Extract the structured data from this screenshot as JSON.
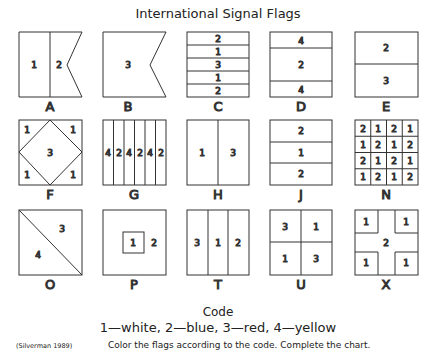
{
  "title": "International Signal Flags",
  "code": {
    "heading": "Code",
    "legend": "1—white, 2—blue, 3—red, 4—yellow",
    "mapping": {
      "1": "white",
      "2": "blue",
      "3": "red",
      "4": "yellow"
    }
  },
  "citation": "(Silverman 1989)",
  "instructions": "Color the flags according to the code. Complete the chart.",
  "flags": [
    {
      "letter": "A",
      "regions": [
        "1",
        "2"
      ]
    },
    {
      "letter": "B",
      "regions": [
        "3"
      ]
    },
    {
      "letter": "C",
      "regions": [
        "2",
        "1",
        "3",
        "1",
        "2"
      ]
    },
    {
      "letter": "D",
      "regions": [
        "4",
        "2",
        "4"
      ]
    },
    {
      "letter": "E",
      "regions": [
        "2",
        "3"
      ]
    },
    {
      "letter": "F",
      "regions": [
        "1",
        "1",
        "3",
        "1",
        "1"
      ]
    },
    {
      "letter": "G",
      "regions": [
        "4",
        "2",
        "4",
        "2",
        "4",
        "2"
      ]
    },
    {
      "letter": "H",
      "regions": [
        "1",
        "3"
      ]
    },
    {
      "letter": "J",
      "regions": [
        "2",
        "1",
        "2"
      ]
    },
    {
      "letter": "N",
      "regions": [
        "2",
        "1",
        "2",
        "1",
        "1",
        "2",
        "1",
        "2",
        "2",
        "1",
        "2",
        "1",
        "1",
        "2",
        "1",
        "2"
      ]
    },
    {
      "letter": "O",
      "regions": [
        "3",
        "4"
      ]
    },
    {
      "letter": "P",
      "regions": [
        "1",
        "2"
      ]
    },
    {
      "letter": "T",
      "regions": [
        "3",
        "1",
        "2"
      ]
    },
    {
      "letter": "U",
      "regions": [
        "3",
        "1",
        "1",
        "3"
      ]
    },
    {
      "letter": "X",
      "regions": [
        "1",
        "1",
        "2",
        "1",
        "1"
      ]
    }
  ]
}
